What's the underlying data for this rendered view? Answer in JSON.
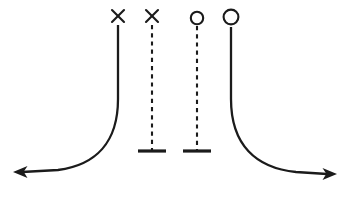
{
  "figure": {
    "title": "",
    "width": 349,
    "height": 199,
    "background_color": "#ffffff",
    "stroke_color": "#1b1b1b"
  },
  "chart_data": {
    "type": "line",
    "title": "",
    "subtitle": "",
    "xlabel": "",
    "ylabel": "",
    "grid": false,
    "legend": "none",
    "axis_ranges": {
      "x": [
        0,
        349
      ],
      "y": [
        0,
        199
      ]
    },
    "series": [
      {
        "name": "outer-left-trajectory",
        "style": "solid",
        "top_marker": "cross",
        "bottom_marker": "arrow",
        "marker_x": 118,
        "marker_y": 16,
        "direction": "left",
        "path": "M118,25 L118,99 C118,142 96,165 58,170 L22,172"
      },
      {
        "name": "inner-left-trajectory",
        "style": "dashed",
        "top_marker": "cross",
        "bottom_marker": "bar",
        "marker_x": 152,
        "marker_y": 16,
        "direction": "none",
        "path": "M152,25 L152,150"
      },
      {
        "name": "inner-right-trajectory",
        "style": "dashed",
        "top_marker": "circle",
        "bottom_marker": "bar",
        "marker_x": 197,
        "marker_y": 18,
        "direction": "none",
        "path": "M197,26 L197,150"
      },
      {
        "name": "outer-right-trajectory",
        "style": "solid",
        "top_marker": "circle",
        "bottom_marker": "arrow",
        "marker_x": 231,
        "marker_y": 17,
        "direction": "right",
        "path": "M231,27 L231,99 C231,145 256,168 296,172 L327,174"
      }
    ],
    "markers": [
      {
        "id": "marker-cross-outer-left",
        "shape": "cross",
        "x": 118,
        "y": 16,
        "size": 12,
        "filled": false
      },
      {
        "id": "marker-cross-inner-left",
        "shape": "cross",
        "x": 152,
        "y": 16,
        "size": 12,
        "filled": false
      },
      {
        "id": "marker-circle-inner-right",
        "shape": "circle",
        "x": 197,
        "y": 18,
        "radius": 6.2,
        "filled": false
      },
      {
        "id": "marker-circle-outer-right",
        "shape": "circle",
        "x": 231,
        "y": 17,
        "radius": 7.4,
        "filled": false
      }
    ],
    "terminators": [
      {
        "id": "bar-inner-left",
        "shape": "bar",
        "x": 152,
        "y": 151,
        "width": 28
      },
      {
        "id": "bar-inner-right",
        "shape": "bar",
        "x": 197,
        "y": 151,
        "width": 28
      },
      {
        "id": "arrow-left",
        "shape": "arrow",
        "x": 13,
        "y": 172,
        "points_to": "left"
      },
      {
        "id": "arrow-right",
        "shape": "arrow",
        "x": 337,
        "y": 174,
        "points_to": "right"
      }
    ],
    "annotations": [],
    "tick_labels": {
      "x": [],
      "y": []
    }
  }
}
